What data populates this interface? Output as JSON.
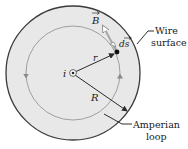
{
  "figure": {
    "center_label": "i",
    "radius_small_label": "r",
    "radius_large_label": "R",
    "b_vector_label": "B",
    "ds_vector_label": "ds",
    "wire_surface_label_line1": "Wire",
    "wire_surface_label_line2": "surface",
    "amperian_label_line1": "Amperian",
    "amperian_label_line2": "loop"
  },
  "colors": {
    "wire_fill": "#e6e6e6",
    "outline": "#3a3a3a",
    "loop": "#9a9a9a",
    "b_vector": "#b0b0b0",
    "text": "#1a1a1a"
  }
}
